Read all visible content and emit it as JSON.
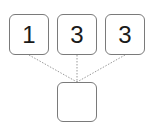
{
  "diagram": {
    "top_boxes": [
      {
        "value": "1"
      },
      {
        "value": "3"
      },
      {
        "value": "3"
      }
    ],
    "target_box": {
      "value": ""
    },
    "connector_style": "dotted",
    "colors": {
      "border": "#7a7a7a",
      "connector": "#9a9a9a",
      "text": "#1a1a1a"
    }
  }
}
